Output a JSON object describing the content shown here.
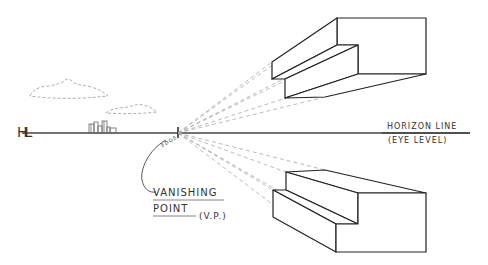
{
  "diagram": {
    "horizon_line": {
      "label": "HORIZON LINE",
      "sublabel": "(EYE LEVEL)",
      "marker": "HL",
      "y": 133
    },
    "vanishing_point": {
      "label_line1": "VANISHING",
      "label_line2": "POINT",
      "abbreviation": "(V.P.)",
      "tag": "EDGE",
      "x": 178,
      "y": 133
    },
    "elements": [
      {
        "name": "upper-stepped-block",
        "position": "above horizon"
      },
      {
        "name": "lower-stepped-block",
        "position": "below horizon"
      },
      {
        "name": "clouds",
        "count": 2,
        "style": "dashed"
      },
      {
        "name": "distant-buildings",
        "position": "on horizon"
      }
    ],
    "colors": {
      "line": "#333333",
      "dashed": "#999999",
      "background": "#ffffff"
    }
  }
}
